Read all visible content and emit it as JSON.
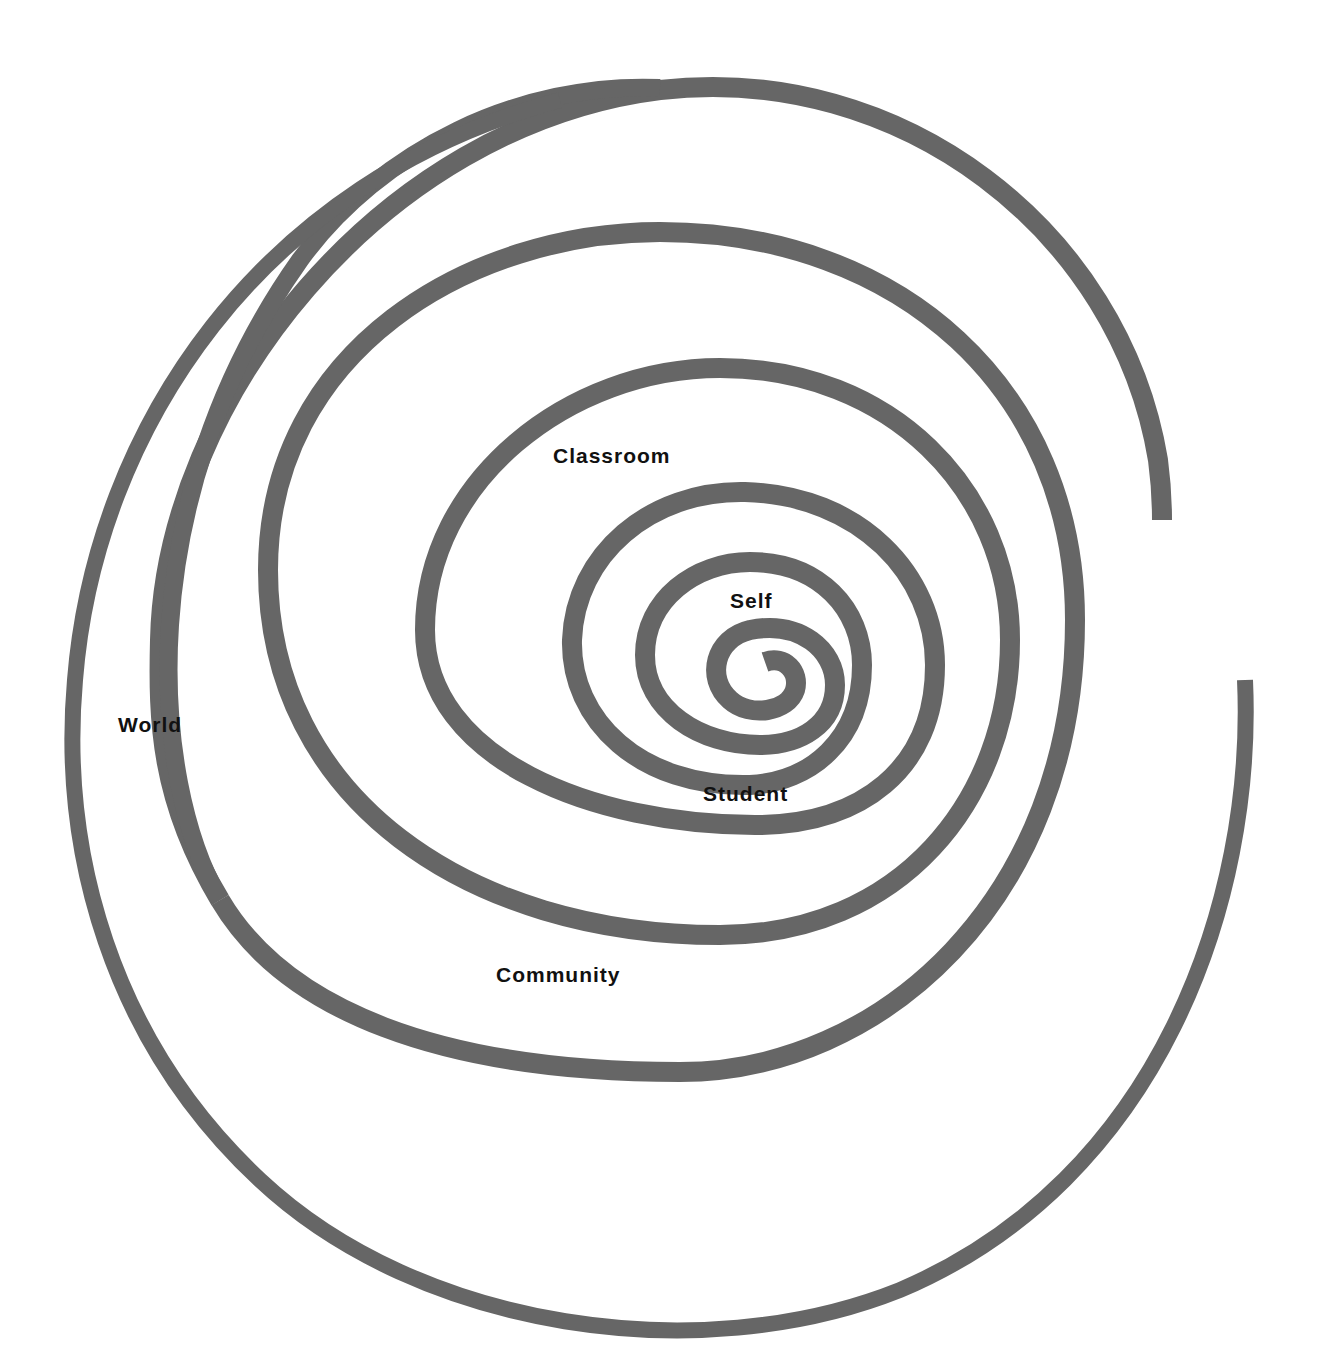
{
  "diagram": {
    "type": "spiral",
    "stroke_color": "#666666",
    "labels": [
      {
        "id": "self",
        "text": "Self"
      },
      {
        "id": "student",
        "text": "Student"
      },
      {
        "id": "classroom",
        "text": "Classroom"
      },
      {
        "id": "community",
        "text": "Community"
      },
      {
        "id": "world",
        "text": "World"
      }
    ]
  }
}
